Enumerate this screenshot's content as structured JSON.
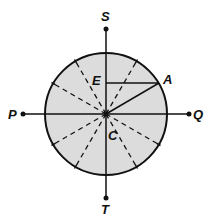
{
  "diagram": {
    "type": "geometry",
    "colors": {
      "circle_fill": "#dcdcdc",
      "stroke": "#111111",
      "background": "#ffffff"
    },
    "circle": {
      "cx": 106,
      "cy": 114,
      "r": 61
    },
    "labels": {
      "S": "S",
      "T": "T",
      "P": "P",
      "Q": "Q",
      "A": "A",
      "E": "E",
      "C": "C"
    },
    "points": {
      "S": {
        "x": 106,
        "y": 29
      },
      "T": {
        "x": 106,
        "y": 198
      },
      "P": {
        "x": 23,
        "y": 114
      },
      "Q": {
        "x": 189,
        "y": 114
      },
      "C": {
        "x": 106,
        "y": 114
      },
      "A": {
        "x": 159,
        "y": 83
      },
      "E": {
        "x": 106,
        "y": 83
      }
    },
    "solid_segments": [
      "PQ",
      "ST",
      "CA",
      "EA"
    ],
    "dashed_radii_angles_deg": [
      60,
      120,
      150,
      210,
      240,
      300,
      330
    ]
  }
}
